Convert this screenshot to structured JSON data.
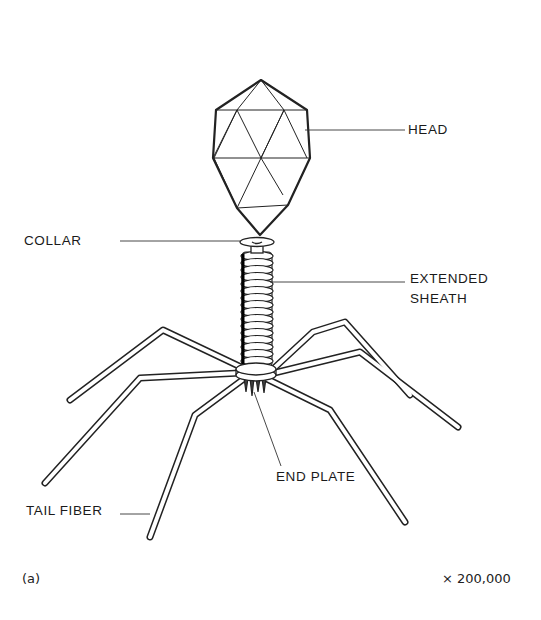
{
  "figure": {
    "panel_label": "(a)",
    "magnification": "× 200,000",
    "labels": {
      "head": "HEAD",
      "collar": "COLLAR",
      "sheath_line1": "EXTENDED",
      "sheath_line2": "SHEATH",
      "end_plate": "END PLATE",
      "tail_fiber": "TAIL FIBER"
    }
  }
}
